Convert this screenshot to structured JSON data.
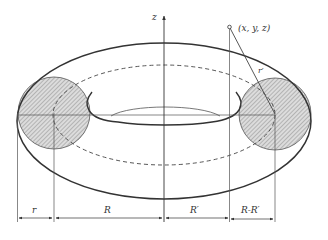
{
  "diagram": {
    "type": "torus-geometry",
    "labels": {
      "z_axis": "z",
      "point": "(x, y, z)",
      "r_prime": "r′",
      "dim_r": "r",
      "dim_R": "R",
      "dim_R_prime": "R′",
      "dim_R_minus_R_prime": "R-R′"
    },
    "colors": {
      "stroke": "#333333",
      "thin_stroke": "#555555",
      "hatch": "#888888",
      "hatch_bg": "#d9d9d9",
      "background": "#ffffff"
    }
  }
}
